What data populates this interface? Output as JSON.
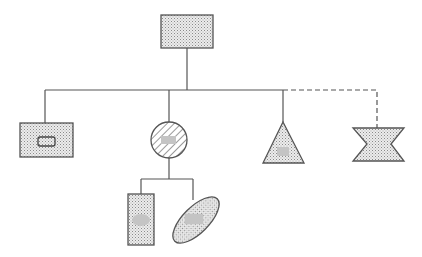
{
  "diagram": {
    "type": "hierarchy-tree",
    "colors": {
      "stroke": "#555555",
      "fill_dotted": "#d9d9d9",
      "inner_patch": "#c4c4c4",
      "background": "#ffffff"
    },
    "nodes": [
      {
        "id": "root",
        "shape": "rectangle",
        "fill": "dotted",
        "inner": "none"
      },
      {
        "id": "child-1",
        "shape": "rectangle",
        "fill": "dotted",
        "inner": "outlined-rounded-rectangle"
      },
      {
        "id": "child-2",
        "shape": "circle",
        "fill": "hatched",
        "inner": "gray-patch"
      },
      {
        "id": "child-3",
        "shape": "triangle",
        "fill": "dotted",
        "inner": "gray-patch"
      },
      {
        "id": "child-4",
        "shape": "hourglass",
        "fill": "dotted",
        "inner": "none"
      },
      {
        "id": "grandchild-1",
        "shape": "tall-rectangle",
        "fill": "dotted",
        "inner": "gray-patch"
      },
      {
        "id": "grandchild-2",
        "shape": "tilted-ellipse",
        "fill": "dotted",
        "inner": "gray-patch"
      }
    ],
    "edges": [
      {
        "from": "root",
        "to": "child-1",
        "style": "solid"
      },
      {
        "from": "root",
        "to": "child-2",
        "style": "solid"
      },
      {
        "from": "root",
        "to": "child-3",
        "style": "solid"
      },
      {
        "from": "root",
        "to": "child-4",
        "style": "dashed"
      },
      {
        "from": "child-2",
        "to": "grandchild-1",
        "style": "solid"
      },
      {
        "from": "child-2",
        "to": "grandchild-2",
        "style": "solid"
      }
    ]
  }
}
